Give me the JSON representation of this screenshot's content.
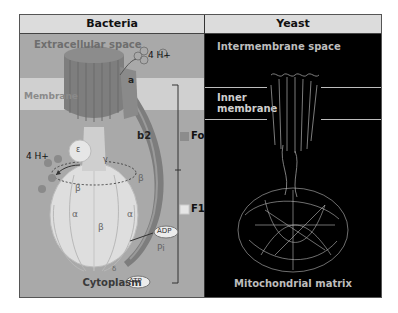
{
  "panels": {
    "bacteria": {
      "title": "Bacteria",
      "extracellular_label": "Extracellular space",
      "membrane_label": "Membrane",
      "cytoplasm_label": "Cytoplasm",
      "proton_top": "4 H+",
      "proton_left": "4 H+",
      "subunits": {
        "c": "c",
        "a": "a",
        "b2": "b2",
        "epsilon": "ε",
        "gamma": "γ",
        "delta": "δ",
        "alpha": "α",
        "beta": "β"
      },
      "legend": [
        {
          "label": "Fo",
          "color": "#8c8c8c"
        },
        {
          "label": "F1",
          "color": "#e6e6e6"
        }
      ],
      "molecules": {
        "adp": "ADP",
        "pi": "Pi",
        "atp": "ATP"
      }
    },
    "yeast": {
      "title": "Yeast",
      "intermembrane_label": "Intermembrane space",
      "inner_membrane_label_1": "Inner",
      "inner_membrane_label_2": "membrane",
      "matrix_label": "Mitochondrial matrix"
    }
  }
}
